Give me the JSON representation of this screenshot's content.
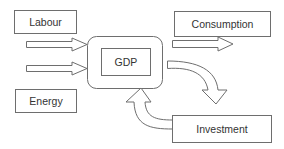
{
  "diagram": {
    "nodes": {
      "labour": "Labour",
      "energy": "Energy",
      "gdp": "GDP",
      "consumption": "Consumption",
      "investment": "Investment"
    },
    "edges": [
      {
        "from": "Labour",
        "to": "GDP"
      },
      {
        "from": "Energy",
        "to": "GDP"
      },
      {
        "from": "GDP",
        "to": "Consumption"
      },
      {
        "from": "GDP",
        "to": "Investment"
      },
      {
        "from": "Investment",
        "to": "GDP"
      }
    ],
    "colors": {
      "stroke": "#6e6e6e",
      "text": "#333333",
      "background": "#ffffff"
    }
  }
}
